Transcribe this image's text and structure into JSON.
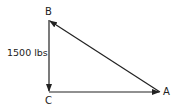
{
  "diagram": {
    "type": "vector-triangle",
    "vertices": {
      "A": {
        "label": "A",
        "x": 160,
        "y": 92
      },
      "B": {
        "label": "B",
        "x": 49,
        "y": 20
      },
      "C": {
        "label": "C",
        "x": 49,
        "y": 92
      }
    },
    "edges": [
      {
        "from": "B",
        "to": "C",
        "arrow_at": "C",
        "label": "1500 lbs"
      },
      {
        "from": "C",
        "to": "A",
        "arrow_at": "A",
        "label": ""
      },
      {
        "from": "A",
        "to": "B",
        "arrow_at": "B",
        "label": ""
      }
    ],
    "force_label": "1500 lbs",
    "line_color": "#222222"
  }
}
